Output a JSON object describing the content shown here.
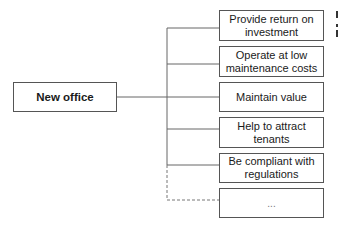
{
  "diagram": {
    "root": {
      "label": "New office"
    },
    "children": [
      {
        "label": "Provide return on investment",
        "line1": "Provide return on",
        "line2": "investment"
      },
      {
        "label": "Operate at low maintenance costs",
        "line1": "Operate at low",
        "line2": "maintenance costs"
      },
      {
        "label": "Maintain value",
        "line1": "Maintain value",
        "line2": ""
      },
      {
        "label": "Help to attract tenants",
        "line1": "Help to attract",
        "line2": "tenants"
      },
      {
        "label": "Be compliant with regulations",
        "line1": "Be compliant with",
        "line2": "regulations"
      },
      {
        "label": "...",
        "line1": "...",
        "line2": "",
        "dashed_connector": true
      }
    ],
    "colors": {
      "line": "#666666",
      "border": "#555555",
      "text": "#1a1a1a"
    }
  }
}
